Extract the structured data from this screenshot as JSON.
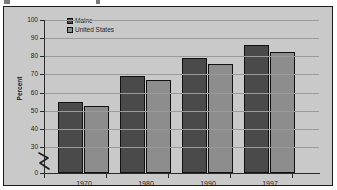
{
  "chart_data": {
    "type": "bar",
    "title": "",
    "xlabel": "",
    "ylabel": "Percent",
    "ylim": [
      0,
      100
    ],
    "yticks": [
      0,
      30,
      40,
      50,
      60,
      70,
      80,
      90,
      100
    ],
    "ytick_labels": [
      "0",
      "30",
      "40",
      "50",
      "60",
      "70",
      "80",
      "90",
      "100"
    ],
    "axis_break": true,
    "axis_break_between": [
      0,
      30
    ],
    "grid": true,
    "legend_position": "top-center",
    "categories": [
      "1970",
      "1980",
      "1990",
      "1997"
    ],
    "series": [
      {
        "name": "Maine",
        "color": "#4a4a4a",
        "values": [
          55,
          69,
          79,
          86.5
        ]
      },
      {
        "name": "United States",
        "color": "#8d8d8d",
        "values": [
          52.5,
          67,
          75.5,
          82.5
        ]
      }
    ]
  },
  "figure": {
    "background_color": "#c9c9c9",
    "border_color": "#1a1a1a",
    "gridline_color": "#9a9a9a",
    "axis_color": "#2b2b2b",
    "text_color": "#1d1d1d"
  }
}
